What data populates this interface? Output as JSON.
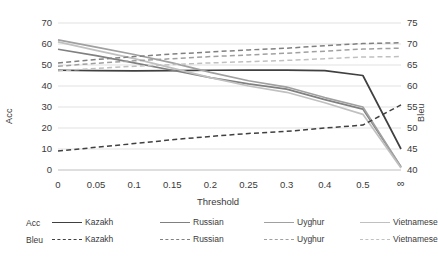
{
  "chart_data": {
    "type": "line",
    "title": "",
    "xlabel": "Threshold",
    "ylabel": "Acc",
    "y2label": "Bleu",
    "categories": [
      "0",
      "0.05",
      "0.1",
      "0.15",
      "0.2",
      "0.25",
      "0.3",
      "0.4",
      "0.5",
      "∞"
    ],
    "x_tick_labels": [
      "0",
      "0.05",
      "0.1",
      "0.15",
      "0.2",
      "0.25",
      "0.3",
      "0.4",
      "0.5",
      "∞"
    ],
    "y_tick_labels": [
      "0",
      "10",
      "20",
      "30",
      "40",
      "50",
      "60",
      "70"
    ],
    "y2_tick_labels": [
      "40",
      "45",
      "50",
      "55",
      "60",
      "65",
      "70",
      "75"
    ],
    "ylim": [
      0,
      70
    ],
    "y2lim": [
      40,
      75
    ],
    "grid": true,
    "legend_position": "bottom",
    "series": [
      {
        "name": "Kazakh",
        "axis": "left",
        "metric": "Acc",
        "style": "solid",
        "color": "#404040",
        "values": [
          47.5,
          47.3,
          47.2,
          47.3,
          47.5,
          47.6,
          47.6,
          47.3,
          45.0,
          10.0
        ]
      },
      {
        "name": "Russian",
        "axis": "left",
        "metric": "Acc",
        "style": "solid",
        "color": "#808080",
        "values": [
          57.5,
          54.5,
          51.0,
          47.5,
          44.0,
          41.0,
          38.5,
          33.5,
          29.0,
          1.5
        ]
      },
      {
        "name": "Uyghur",
        "axis": "left",
        "metric": "Acc",
        "style": "solid",
        "color": "#a0a0a0",
        "values": [
          62.0,
          58.5,
          55.0,
          51.0,
          46.5,
          42.5,
          39.5,
          34.5,
          30.0,
          1.5
        ]
      },
      {
        "name": "Vietnamese",
        "axis": "left",
        "metric": "Acc",
        "style": "solid",
        "color": "#c0c0c0",
        "values": [
          61.0,
          57.0,
          53.0,
          48.5,
          44.0,
          40.0,
          37.0,
          32.0,
          26.5,
          1.0
        ]
      },
      {
        "name": "Kazakh",
        "axis": "right",
        "metric": "Bleu",
        "style": "dashed",
        "color": "#404040",
        "values": [
          44.5,
          45.4,
          46.3,
          47.2,
          48.0,
          48.7,
          49.2,
          50.0,
          50.7,
          55.5
        ]
      },
      {
        "name": "Russian",
        "axis": "right",
        "metric": "Bleu",
        "style": "dashed",
        "color": "#808080",
        "values": [
          65.5,
          66.3,
          67.0,
          67.6,
          68.1,
          68.6,
          69.0,
          69.6,
          70.1,
          70.3
        ]
      },
      {
        "name": "Uyghur",
        "axis": "right",
        "metric": "Bleu",
        "style": "dashed",
        "color": "#a0a0a0",
        "values": [
          64.7,
          65.4,
          66.0,
          66.5,
          67.0,
          67.4,
          67.8,
          68.3,
          68.8,
          69.0
        ]
      },
      {
        "name": "Vietnamese",
        "axis": "right",
        "metric": "Bleu",
        "style": "dashed",
        "color": "#c0c0c0",
        "values": [
          63.6,
          64.2,
          64.7,
          65.1,
          65.5,
          65.8,
          66.1,
          66.5,
          66.9,
          67.0
        ]
      }
    ],
    "legend": {
      "rows": [
        {
          "label": "Acc",
          "style": "solid",
          "entries": [
            "Kazakh",
            "Russian",
            "Uyghur",
            "Vietnamese"
          ]
        },
        {
          "label": "Bleu",
          "style": "dashed",
          "entries": [
            "Kazakh",
            "Russian",
            "Uyghur",
            "Vietnamese"
          ]
        }
      ],
      "colors": [
        "#404040",
        "#808080",
        "#a0a0a0",
        "#c0c0c0"
      ]
    }
  }
}
